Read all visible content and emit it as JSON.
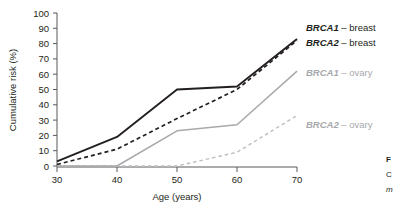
{
  "figure": {
    "caption_lines": [
      "F",
      "C",
      "m"
    ]
  },
  "chart_data": {
    "type": "line",
    "title": "",
    "xlabel": "Age (years)",
    "ylabel": "Cumulative risk (%)",
    "x": [
      30,
      40,
      50,
      60,
      70
    ],
    "xlim": [
      30,
      70
    ],
    "ylim": [
      0,
      100
    ],
    "xticks": [
      30,
      40,
      50,
      60,
      70
    ],
    "yticks": [
      0,
      10,
      20,
      30,
      40,
      50,
      60,
      70,
      80,
      90,
      100
    ],
    "xtick_labels": [
      "30",
      "40",
      "50",
      "60",
      "70"
    ],
    "ytick_labels": [
      "0",
      "10",
      "20",
      "30",
      "40",
      "50",
      "60",
      "70",
      "80",
      "90",
      "100"
    ],
    "grid": false,
    "legend_position": "right-inline",
    "series": [
      {
        "name": "BRCA1 – breast",
        "gene": "BRCA1",
        "suffix": " – breast",
        "values": [
          3,
          19,
          50,
          52,
          83
        ],
        "style": "solid",
        "color": "#231f20"
      },
      {
        "name": "BRCA2 – breast",
        "gene": "BRCA2",
        "suffix": " – breast",
        "values": [
          1,
          11,
          31,
          50,
          82
        ],
        "style": "dashed",
        "color": "#231f20"
      },
      {
        "name": "BRCA1 – ovary",
        "gene": "BRCA1",
        "suffix": " – ovary",
        "values": [
          0,
          0,
          23,
          27,
          62
        ],
        "style": "solid",
        "color": "#a7a9ac"
      },
      {
        "name": "BRCA2 – ovary",
        "gene": "BRCA2",
        "suffix": " – ovary",
        "values": [
          0,
          0,
          0,
          9,
          33
        ],
        "style": "dashed",
        "color": "#bcbec0"
      }
    ]
  }
}
